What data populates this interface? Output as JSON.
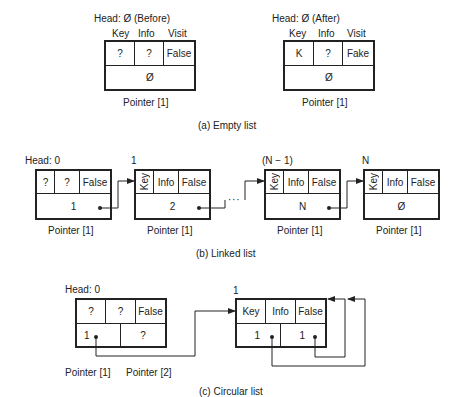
{
  "panel_a": {
    "caption": "(a)   Empty list",
    "before": {
      "head_label": "Head: Ø   (Before)",
      "columns": [
        "Key",
        "Info",
        "Visit"
      ],
      "cells": [
        "?",
        "?",
        "False"
      ],
      "pointer_value": "Ø",
      "pointer_label": "Pointer [1]"
    },
    "after": {
      "head_label": "Head: Ø   (After)",
      "columns": [
        "Key",
        "Info",
        "Visit"
      ],
      "cells": [
        "K",
        "?",
        "Fake"
      ],
      "pointer_value": "Ø",
      "pointer_label": "Pointer [1]"
    }
  },
  "panel_b": {
    "caption": "(b)   Linked list",
    "ellipsis": "· · ·",
    "nodes": [
      {
        "index_label": "Head: 0",
        "cells": [
          "?",
          "?",
          "False"
        ],
        "pointer_value": "1",
        "pointer_label": "Pointer [1]"
      },
      {
        "index_label": "1",
        "cells": [
          "Key",
          "Info",
          "False"
        ],
        "pointer_value": "2",
        "pointer_label": "Pointer [1]"
      },
      {
        "index_label": "(N − 1)",
        "cells": [
          "Key",
          "Info",
          "False"
        ],
        "pointer_value": "N",
        "pointer_label": "Pointer [1]"
      },
      {
        "index_label": "N",
        "cells": [
          "Key",
          "Info",
          "False"
        ],
        "pointer_value": "Ø",
        "pointer_label": "Pointer [1]"
      }
    ]
  },
  "panel_c": {
    "caption": "(c)   Circular list",
    "head": {
      "index_label": "Head: 0",
      "cells": [
        "?",
        "?",
        "False"
      ],
      "pointers": [
        "1",
        "?"
      ],
      "pointer_labels": [
        "Pointer [1]",
        "Pointer [2]"
      ]
    },
    "node": {
      "index_label": "1",
      "cells": [
        "Key",
        "Info",
        "False"
      ],
      "pointers": [
        "1",
        "1"
      ]
    }
  },
  "colors": {
    "line": "#222222",
    "background": "#ffffff"
  }
}
